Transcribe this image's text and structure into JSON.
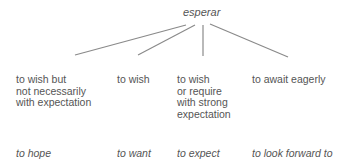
{
  "diagram": {
    "root": "esperar",
    "branches": [
      {
        "meaning": [
          "to wish but",
          "not necessarily",
          "with expectation"
        ],
        "translation": "to hope"
      },
      {
        "meaning": [
          "to wish"
        ],
        "translation": "to want"
      },
      {
        "meaning": [
          "to wish",
          "or require",
          "with strong",
          "expectation"
        ],
        "translation": "to expect"
      },
      {
        "meaning": [
          "to await eagerly"
        ],
        "translation": "to look forward to"
      }
    ],
    "line_color": "#8a8a8a"
  }
}
